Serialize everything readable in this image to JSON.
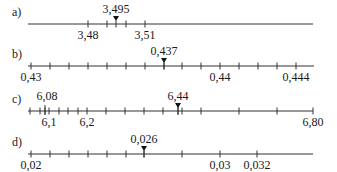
{
  "lines": [
    {
      "id": "a",
      "label": "a)",
      "y": 24,
      "x_start": 28,
      "x_end": 313,
      "ticks": [
        88,
        107,
        126,
        145
      ],
      "marker": {
        "x": 116,
        "value": "3,495"
      },
      "below_labels": [
        {
          "x": 88,
          "text": "3,48"
        },
        {
          "x": 145,
          "text": "3,51"
        }
      ],
      "above_labels": []
    },
    {
      "id": "b",
      "label": "b)",
      "y": 66,
      "x_start": 28,
      "x_end": 314,
      "ticks": [
        31,
        50,
        69,
        88,
        107,
        126,
        145,
        164,
        182,
        201,
        220,
        239,
        258,
        277,
        296
      ],
      "marker": {
        "x": 164,
        "value": "0,437"
      },
      "below_labels": [
        {
          "x": 31,
          "text": "0,43"
        },
        {
          "x": 220,
          "text": "0,44"
        },
        {
          "x": 296,
          "text": "0,444"
        }
      ],
      "above_labels": []
    },
    {
      "id": "c",
      "label": "c)",
      "y": 111,
      "x_start": 28,
      "x_end": 313,
      "ticks": [
        30,
        40,
        45,
        49,
        59,
        68,
        78,
        87,
        106,
        125,
        144,
        163,
        182,
        201,
        239,
        277,
        313
      ],
      "long_ticks": [
        45,
        178
      ],
      "marker": {
        "x": 178,
        "value": "6,44"
      },
      "below_labels": [
        {
          "x": 49,
          "text": "6,1"
        },
        {
          "x": 87,
          "text": "6,2"
        },
        {
          "x": 313,
          "text": "6,80"
        }
      ],
      "above_labels": [
        {
          "x": 47,
          "text": "6,08"
        }
      ]
    },
    {
      "id": "d",
      "label": "d)",
      "y": 154,
      "x_start": 28,
      "x_end": 313,
      "ticks": [
        31,
        50,
        69,
        88,
        107,
        126,
        144,
        182,
        220,
        257
      ],
      "marker": {
        "x": 144,
        "value": "0,026"
      },
      "below_labels": [
        {
          "x": 31,
          "text": "0,02"
        },
        {
          "x": 220,
          "text": "0,03"
        },
        {
          "x": 257,
          "text": "0,032"
        }
      ],
      "above_labels": []
    }
  ]
}
